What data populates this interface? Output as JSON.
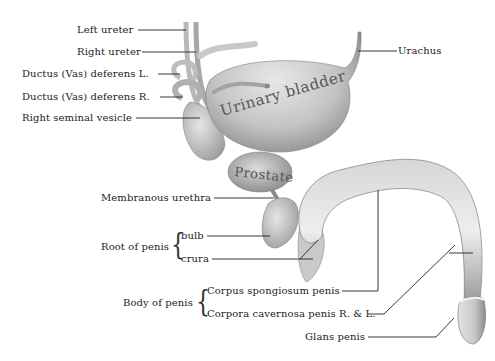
{
  "figure": {
    "organ_labels": {
      "bladder": "Urinary bladder",
      "prostate": "Prostate"
    },
    "labels": {
      "left_ureter": "Left ureter",
      "right_ureter": "Right ureter",
      "ductus_l": "Ductus (Vas) deferens L.",
      "ductus_r": "Ductus (Vas) deferens R.",
      "seminal_vesicle": "Right seminal vesicle",
      "urachus": "Urachus",
      "membranous_urethra": "Membranous urethra",
      "root_of_penis": "Root of penis",
      "bulb": "bulb",
      "crura": "crura",
      "body_of_penis": "Body of penis",
      "corpus_spongiosum": "Corpus spongiosum penis",
      "corpora_cavernosa": "Corpora cavernosa penis R. & L.",
      "glans_penis": "Glans penis"
    },
    "brace_char": "{"
  }
}
